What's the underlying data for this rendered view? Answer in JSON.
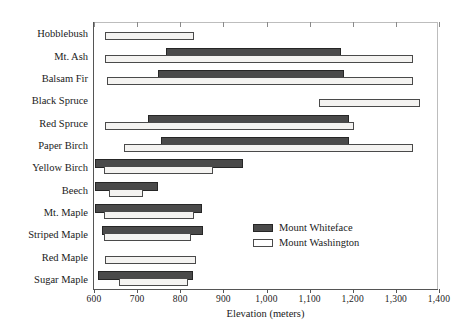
{
  "chart_data": {
    "type": "bar",
    "orientation": "horizontal",
    "title": "",
    "xlabel": "Elevation (meters)",
    "ylabel": "",
    "xlim": [
      600,
      1400
    ],
    "xticks": [
      600,
      700,
      800,
      900,
      1000,
      1100,
      1200,
      1300,
      1400
    ],
    "xticklabels": [
      "600",
      "700",
      "800",
      "900",
      "1,000",
      "1,100",
      "1,200",
      "1,300",
      "1,400"
    ],
    "grid": false,
    "legend_position": "center-right",
    "categories": [
      "Hobblebush",
      "Mt. Ash",
      "Balsam Fir",
      "Black Spruce",
      "Red Spruce",
      "Paper Birch",
      "Yellow Birch",
      "Beech",
      "Mt. Maple",
      "Striped Maple",
      "Red Maple",
      "Sugar Maple"
    ],
    "series": [
      {
        "name": "Mount Whiteface",
        "color": "#4a4a4a",
        "ranges": [
          null,
          [
            767,
            1173
          ],
          [
            748,
            1180
          ],
          null,
          [
            725,
            1192
          ],
          [
            755,
            1192
          ],
          [
            602,
            946
          ],
          [
            602,
            748
          ],
          [
            602,
            851
          ],
          [
            618,
            853
          ],
          null,
          [
            610,
            830
          ]
        ]
      },
      {
        "name": "Mount Washington",
        "color": "#ffffff",
        "ranges": [
          [
            625,
            832
          ],
          [
            625,
            1340
          ],
          [
            630,
            1340
          ],
          [
            1122,
            1356
          ],
          [
            625,
            1204
          ],
          [
            670,
            1340
          ],
          [
            623,
            876
          ],
          [
            635,
            714
          ],
          [
            623,
            832
          ],
          [
            623,
            825
          ],
          [
            625,
            837
          ],
          [
            658,
            818
          ]
        ]
      }
    ]
  },
  "legend": {
    "items": [
      {
        "label": "Mount Whiteface",
        "key": "whiteface"
      },
      {
        "label": "Mount Washington",
        "key": "washington"
      }
    ]
  }
}
